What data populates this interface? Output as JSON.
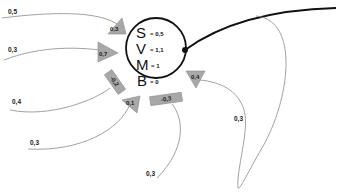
{
  "node": {
    "variables": [
      {
        "letter": "S",
        "value": "= 0,5"
      },
      {
        "letter": "V",
        "value": "= 1,1"
      },
      {
        "letter": "M",
        "value": "= 1"
      },
      {
        "letter": "B",
        "value": "= 0"
      }
    ]
  },
  "incoming_edges": [
    {
      "edge_label": "0,5",
      "marker_label": "0,3",
      "marker_shape": "triangle"
    },
    {
      "edge_label": "0,3",
      "marker_label": "0,7",
      "marker_shape": "triangle"
    },
    {
      "edge_label": "0,4",
      "marker_label": "-0,2",
      "marker_shape": "rectangle"
    },
    {
      "edge_label": "0,3",
      "marker_label": "0,1",
      "marker_shape": "triangle"
    },
    {
      "edge_label": "0,3",
      "marker_label": "-0,3",
      "marker_shape": "rectangle"
    },
    {
      "edge_label": "0,3",
      "marker_label": "0,4",
      "marker_shape": "triangle"
    }
  ],
  "outgoing_edge": {
    "style": "thick"
  },
  "colors": {
    "marker_fill": "#a8a8a8",
    "thin_edge": "#8a8a8a",
    "thick_edge": "#111111"
  }
}
